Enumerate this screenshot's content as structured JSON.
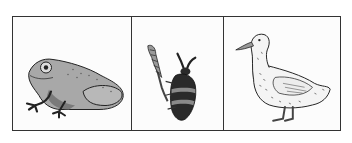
{
  "panels": [
    {
      "id": "panel-1",
      "subject": "frog",
      "icon": "frog-icon"
    },
    {
      "id": "panel-2",
      "subject": "beetle on plant stem",
      "icon": "beetle-icon"
    },
    {
      "id": "panel-3",
      "subject": "duck",
      "icon": "duck-icon"
    }
  ],
  "colors": {
    "border": "#333333",
    "background": "#fcfcfc",
    "frog_body": "#a8a8a8",
    "beetle_dark": "#2a2a2a",
    "beetle_band": "#8a8a8a",
    "duck_body": "#f4f4f4"
  }
}
